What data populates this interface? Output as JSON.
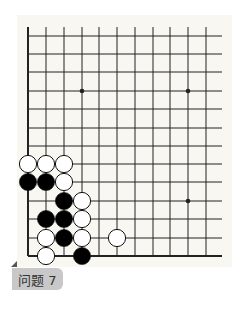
{
  "problem": {
    "label": "问题 7"
  },
  "board": {
    "colors": {
      "background": "#f8f7f2",
      "line": "#222222",
      "black": "#000000",
      "white": "#ffffff"
    },
    "columns_x": [
      28,
      46,
      64,
      82,
      99,
      117,
      135,
      153,
      170,
      188,
      206
    ],
    "rows_y": [
      36,
      54,
      72,
      91,
      109,
      128,
      146,
      164,
      182,
      201,
      219,
      238,
      256
    ],
    "right_edge_x": 222,
    "top_edge_y": 27,
    "star_points": [
      [
        3,
        3
      ],
      [
        9,
        3
      ],
      [
        9,
        9
      ]
    ],
    "stones": [
      {
        "col": 0,
        "row": 7,
        "color": "white"
      },
      {
        "col": 1,
        "row": 7,
        "color": "white"
      },
      {
        "col": 2,
        "row": 7,
        "color": "white"
      },
      {
        "col": 0,
        "row": 8,
        "color": "black"
      },
      {
        "col": 1,
        "row": 8,
        "color": "black"
      },
      {
        "col": 2,
        "row": 8,
        "color": "white"
      },
      {
        "col": 2,
        "row": 9,
        "color": "black"
      },
      {
        "col": 3,
        "row": 9,
        "color": "white"
      },
      {
        "col": 1,
        "row": 10,
        "color": "black"
      },
      {
        "col": 2,
        "row": 10,
        "color": "black"
      },
      {
        "col": 3,
        "row": 10,
        "color": "white"
      },
      {
        "col": 1,
        "row": 11,
        "color": "white"
      },
      {
        "col": 2,
        "row": 11,
        "color": "black"
      },
      {
        "col": 3,
        "row": 11,
        "color": "white"
      },
      {
        "col": 5,
        "row": 11,
        "color": "white"
      },
      {
        "col": 1,
        "row": 12,
        "color": "white"
      },
      {
        "col": 3,
        "row": 12,
        "color": "black"
      }
    ]
  }
}
